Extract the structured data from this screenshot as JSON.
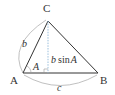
{
  "diagram": {
    "type": "triangle-area",
    "vertices": {
      "A": {
        "label": "A",
        "x": 23,
        "y": 73
      },
      "B": {
        "label": "B",
        "x": 98,
        "y": 73
      },
      "C": {
        "label": "C",
        "x": 48,
        "y": 21
      }
    },
    "side_labels": {
      "b": "b",
      "c": "c"
    },
    "angle_label": "A",
    "height_label": {
      "prefix": "b",
      "func": "sin",
      "arg": "A"
    },
    "colors": {
      "edge": "#333333",
      "altitude": "#8fb8d8",
      "arc": "#aaaaaa",
      "text": "#333333"
    }
  }
}
